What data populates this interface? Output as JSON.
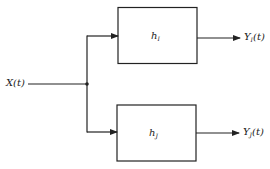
{
  "diagram": {
    "type": "block-diagram",
    "input": {
      "label": "X(t)"
    },
    "blocks": [
      {
        "id": "hI",
        "label_main": "h",
        "label_sub": "I"
      },
      {
        "id": "hJ",
        "label_main": "h",
        "label_sub": "J"
      }
    ],
    "outputs": [
      {
        "label_main": "Y",
        "label_sub": "I",
        "label_arg": "(t)"
      },
      {
        "label_main": "Y",
        "label_sub": "J",
        "label_arg": "(t)"
      }
    ],
    "colors": {
      "line": "#222222",
      "background": "#ffffff"
    }
  }
}
